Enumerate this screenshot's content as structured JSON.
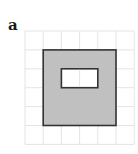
{
  "figure": {
    "label": "a",
    "grid": {
      "columns": 6,
      "rows": 6,
      "origin_x": 25,
      "origin_y": 31,
      "cell_width": 18.2,
      "cell_height": 18.9,
      "line_color": "#e4e4e4"
    },
    "outer_square": {
      "col": 1,
      "row": 1,
      "cols": 4,
      "rows": 4,
      "fill": "#c0c0c0",
      "stroke": "#333333"
    },
    "inner_hole": {
      "col": 2,
      "row": 2,
      "cols": 2,
      "rows": 1,
      "fill": "#ffffff",
      "stroke": "#333333"
    }
  }
}
